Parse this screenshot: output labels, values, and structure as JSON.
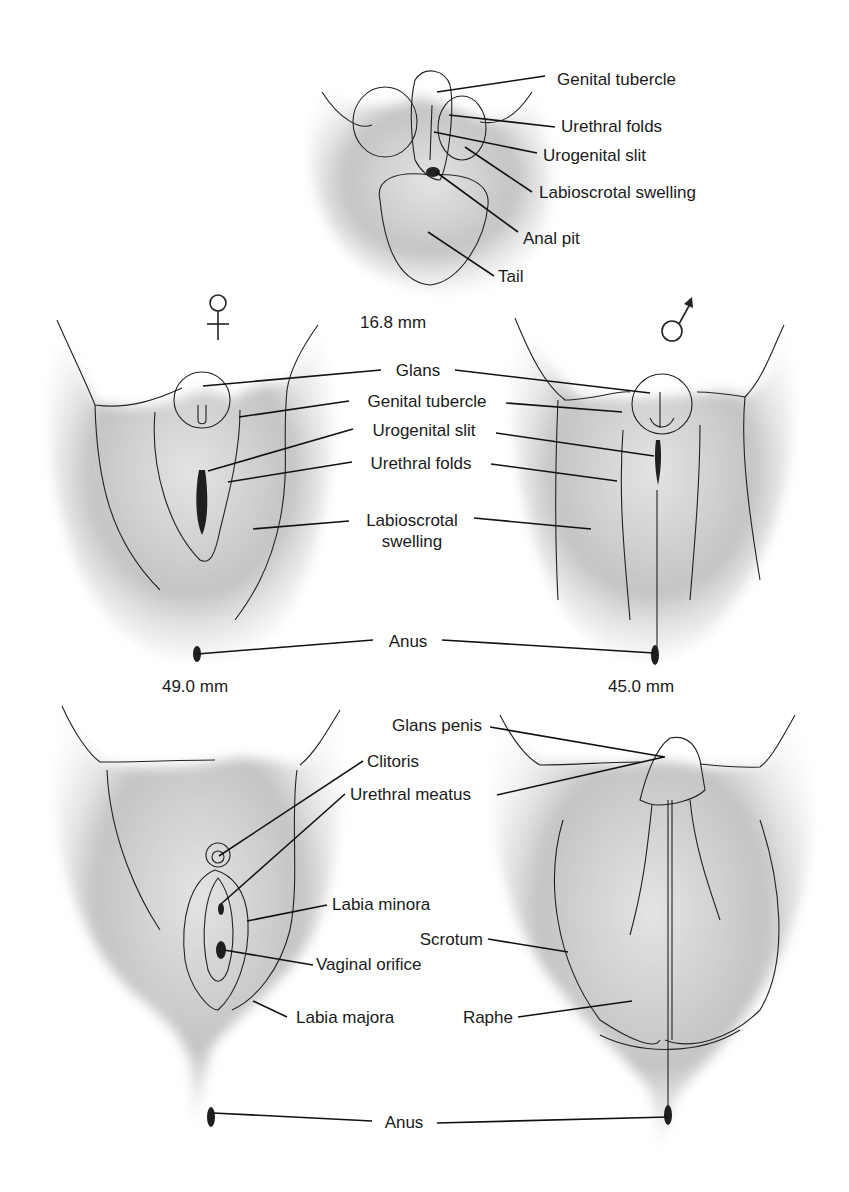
{
  "stage_top": {
    "size_label": "16.8 mm",
    "labels": {
      "genital_tubercle": "Genital tubercle",
      "urethral_folds": "Urethral folds",
      "urogenital_slit": "Urogenital slit",
      "labioscrotal_swelling": "Labioscrotal swelling",
      "anal_pit": "Anal pit",
      "tail": "Tail"
    }
  },
  "stage_middle": {
    "female_symbol": "female-symbol",
    "male_symbol": "male-symbol",
    "female_size_label": "49.0 mm",
    "male_size_label": "45.0 mm",
    "labels": {
      "glans": "Glans",
      "genital_tubercle": "Genital tubercle",
      "urogenital_slit": "Urogenital slit",
      "urethral_folds": "Urethral folds",
      "labioscrotal_line1": "Labioscrotal",
      "labioscrotal_line2": "swelling",
      "anus": "Anus"
    }
  },
  "stage_bottom": {
    "labels": {
      "glans_penis": "Glans penis",
      "clitoris": "Clitoris",
      "urethral_meatus": "Urethral meatus",
      "labia_minora": "Labia minora",
      "scrotum": "Scrotum",
      "vaginal_orifice": "Vaginal orifice",
      "labia_majora": "Labia majora",
      "raphe": "Raphe",
      "anus": "Anus"
    }
  },
  "colors": {
    "skin_light": "#d9d9d9",
    "skin_mid": "#b8b8b8",
    "skin_dark": "#8e8e8e",
    "outline": "#222222",
    "text": "#1a1a1a"
  }
}
